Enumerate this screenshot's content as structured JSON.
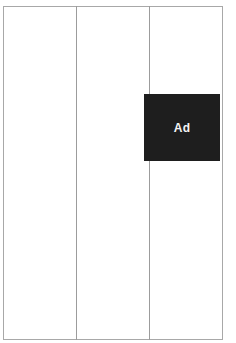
{
  "layout": {
    "columns": 3
  },
  "ad": {
    "label": "Ad",
    "background": "#1e1e1e",
    "text_color": "#f4f4f4"
  },
  "colors": {
    "border": "#a8a8a8",
    "background": "#ffffff"
  }
}
